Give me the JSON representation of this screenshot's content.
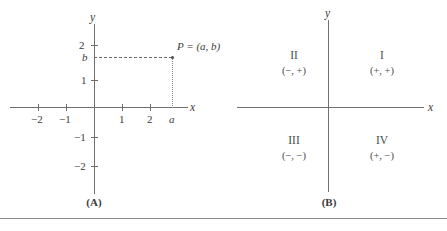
{
  "figure": {
    "panels": [
      {
        "id": "A",
        "caption": "(A)",
        "axis_labels": {
          "x": "x",
          "y": "y"
        },
        "x_ticks": [
          {
            "value": -2,
            "label": "−2"
          },
          {
            "value": -1,
            "label": "−1"
          },
          {
            "value": 1,
            "label": "1"
          },
          {
            "value": 2,
            "label": "2"
          }
        ],
        "y_ticks": [
          {
            "value": 2,
            "label": "2"
          },
          {
            "value": 1,
            "label": "1"
          },
          {
            "value": -1,
            "label": "−1"
          },
          {
            "value": -2,
            "label": "−2"
          }
        ],
        "point": {
          "label": "P = (a, b)",
          "x_label": "a",
          "y_label": "b"
        }
      },
      {
        "id": "B",
        "caption": "(B)",
        "axis_labels": {
          "x": "x",
          "y": "y"
        },
        "quadrants": [
          {
            "roman": "I",
            "signs": "(+, +)"
          },
          {
            "roman": "II",
            "signs": "(−, +)"
          },
          {
            "roman": "III",
            "signs": "(−, −)"
          },
          {
            "roman": "IV",
            "signs": "(+, −)"
          }
        ]
      }
    ]
  }
}
